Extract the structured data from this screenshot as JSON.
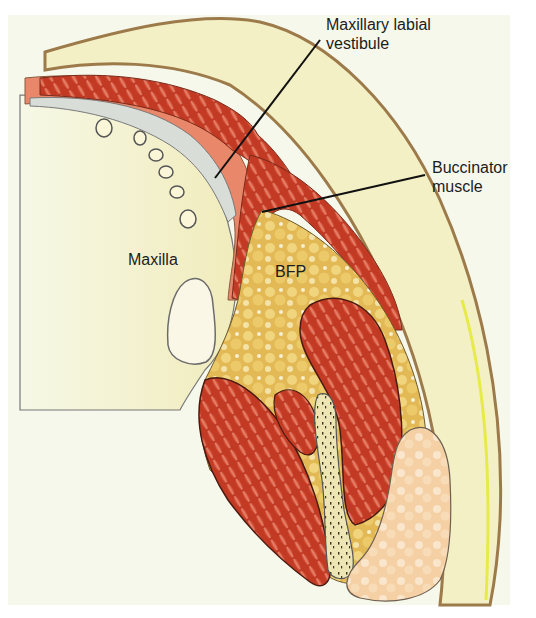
{
  "figure": {
    "labels": {
      "vestibule": [
        "Maxillary labial",
        "vestibule"
      ],
      "buccinator": [
        "Buccinator",
        "muscle"
      ],
      "maxilla": "Maxilla",
      "bfp": "BFP"
    },
    "colors": {
      "background": "#f6f8ec",
      "skin_outline": "#9c7a4a",
      "subcutaneous": "#f3efc4",
      "muscle": "#c8402a",
      "mucosa": "#e88a6c",
      "fat": "#e6bf58",
      "bone": "#f2efc8",
      "parotid": "#f6d2a8"
    }
  }
}
